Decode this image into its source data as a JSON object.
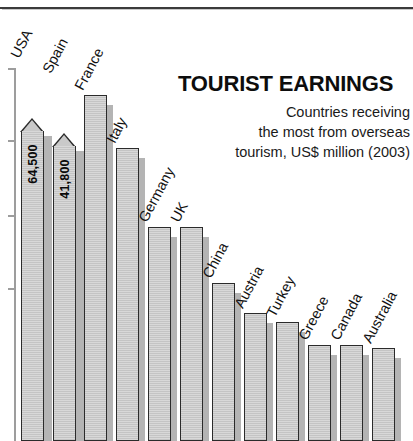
{
  "chart_data": {
    "type": "bar",
    "title": "TOURIST EARNINGS",
    "subtitle_lines": [
      "Countries receiving",
      "the most from overseas",
      "tourism, US$ million (2003)"
    ],
    "xlabel": "",
    "ylabel": "",
    "ylim": [
      0,
      70000
    ],
    "grid": false,
    "legend": "none",
    "units": "US$ million",
    "year": "2003",
    "categories": [
      "USA",
      "Spain",
      "France",
      "Italy",
      "Germany",
      "UK",
      "China",
      "Austria",
      "Turkey",
      "Greece",
      "Canada",
      "Australia"
    ],
    "values": [
      64500,
      41800,
      36600,
      31300,
      23000,
      23000,
      17400,
      14000,
      13200,
      10700,
      10700,
      10400
    ],
    "value_labels": {
      "USA": "64,500",
      "Spain": "41,800"
    },
    "labeled_bars": [
      "USA",
      "Spain"
    ],
    "axis_tick_count": 4
  },
  "bars": [
    {
      "label": "USA",
      "value": 64500,
      "value_label": "64,500",
      "x": 20,
      "top": 118,
      "flag": true,
      "label_y": 60
    },
    {
      "label": "Spain",
      "value": 41800,
      "value_label": "41,800",
      "x": 52,
      "top": 133,
      "flag": true,
      "label_y": 75
    },
    {
      "label": "France",
      "value": 36600,
      "value_label": "",
      "x": 84,
      "top": 95,
      "flag": false,
      "label_y": 92
    },
    {
      "label": "Italy",
      "value": 31300,
      "value_label": "",
      "x": 116,
      "top": 148,
      "flag": false,
      "label_y": 145
    },
    {
      "label": "Germany",
      "value": 23000,
      "value_label": "",
      "x": 148,
      "top": 227,
      "flag": false,
      "label_y": 224
    },
    {
      "label": "UK",
      "value": 23000,
      "value_label": "",
      "x": 180,
      "top": 227,
      "flag": false,
      "label_y": 224
    },
    {
      "label": "China",
      "value": 17400,
      "value_label": "",
      "x": 212,
      "top": 283,
      "flag": false,
      "label_y": 280
    },
    {
      "label": "Austria",
      "value": 14000,
      "value_label": "",
      "x": 244,
      "top": 313,
      "flag": false,
      "label_y": 310
    },
    {
      "label": "Turkey",
      "value": 13200,
      "value_label": "",
      "x": 276,
      "top": 322,
      "flag": false,
      "label_y": 319
    },
    {
      "label": "Greece",
      "value": 10700,
      "value_label": "",
      "x": 308,
      "top": 345,
      "flag": false,
      "label_y": 342
    },
    {
      "label": "Canada",
      "value": 10700,
      "value_label": "",
      "x": 340,
      "top": 345,
      "flag": false,
      "label_y": 342
    },
    {
      "label": "Australia",
      "value": 10400,
      "value_label": "",
      "x": 372,
      "top": 348,
      "flag": false,
      "label_y": 345
    }
  ],
  "axis": {
    "ticks_y": [
      68,
      140,
      215,
      288
    ]
  },
  "colors": {
    "bar_fill": "#d0d0d0",
    "bar_outline": "#2b2b2b",
    "bar_shadow": "#b4b4b4",
    "text": "#111111",
    "axis": "#9d9d9d",
    "background": "#ffffff"
  }
}
